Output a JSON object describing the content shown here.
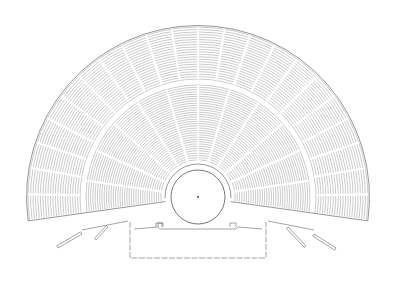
{
  "diagram": {
    "type": "architectural-plan",
    "colors": {
      "background": "#ffffff",
      "line": "#6a6a6a",
      "seat_rows": "#8a8a8a"
    },
    "center": {
      "x": 198,
      "y": 197
    },
    "orchestra": {
      "radius": 27,
      "center_mark": true
    },
    "cavea": {
      "start_angle_deg": -8,
      "end_angle_deg": 188,
      "inner_radius": 33,
      "lower_tier": {
        "inner": 35,
        "outer": 112,
        "wedges": 12,
        "rows": 34
      },
      "diazoma": {
        "radius": 115
      },
      "upper_tier": {
        "inner": 118,
        "outer": 170,
        "wedges": 22,
        "rows": 21
      }
    },
    "skene": {
      "front_y": 231,
      "back_y": 258,
      "left_x": 130,
      "right_x": 266
    }
  }
}
